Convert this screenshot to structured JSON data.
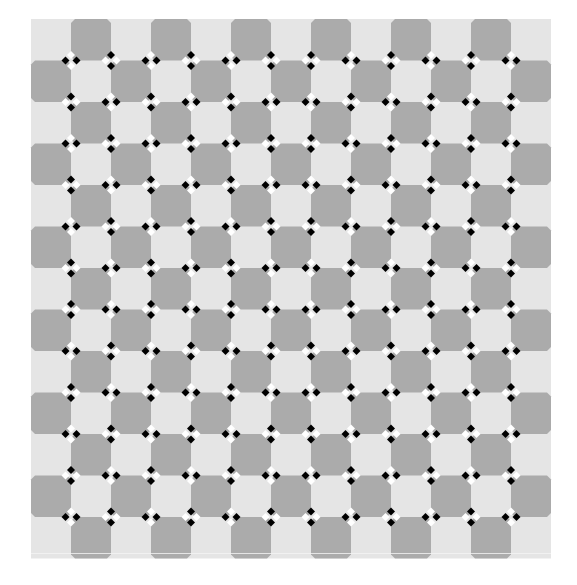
{
  "title": "Checkerboard bulge illusion",
  "canvas": {
    "width": 577,
    "height": 585,
    "background": "#ffffff"
  },
  "grid": {
    "x0": 31,
    "y0": 19,
    "cols": 13,
    "rows": 13,
    "cell_w": 40,
    "cell_h": 41.5,
    "light_color": "#e5e5e5",
    "dark_color": "#ababab",
    "dark_parity": 1,
    "chamfer": 4
  },
  "markers": {
    "black_color": "#000000",
    "white_color": "#ffffff",
    "diamond_half": 4,
    "offset": 5.5,
    "orientation_legend": {
      "H": "black diamonds left and right, white diamonds top and bottom",
      "V": "black diamonds top and bottom, white diamonds left and right"
    },
    "quadrants": {
      "split_col": 6,
      "split_row": 6,
      "top_left_even": "H",
      "top_right_even": "V",
      "bottom_left_even": "V",
      "bottom_right_even": "H"
    }
  },
  "bottom_line": {
    "y": 553,
    "color": "#f4f4f4"
  }
}
